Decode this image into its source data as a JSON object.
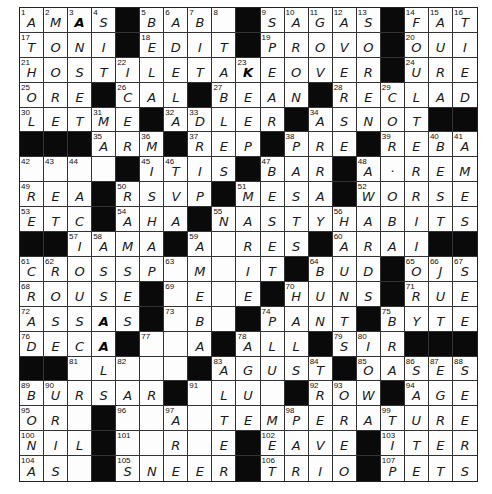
{
  "puzzle": {
    "rows": 19,
    "cols": 19,
    "colors": {
      "black_square": "#0a0a0a",
      "cell_bg": "#fdfdfd",
      "grid_line": "#333333",
      "ink": "#1a1a1a"
    },
    "grid": [
      [
        "A",
        "M",
        "A",
        "S",
        "#",
        "B",
        "A",
        "B",
        "",
        "#",
        "S",
        "A",
        "G",
        "A",
        "S",
        "#",
        "F",
        "A",
        "T"
      ],
      [
        "T",
        "O",
        "N",
        "I",
        "#",
        "E",
        "D",
        "I",
        "T",
        "#",
        "P",
        "R",
        "O",
        "V",
        "O",
        "#",
        "O",
        "U",
        "I"
      ],
      [
        "H",
        "O",
        "S",
        "T",
        "I",
        "L",
        "E",
        "T",
        "A",
        "K",
        "E",
        "O",
        "V",
        "E",
        "R",
        "#",
        "U",
        "R",
        "E"
      ],
      [
        "O",
        "R",
        "E",
        "#",
        "C",
        "A",
        "L",
        "#",
        "B",
        "E",
        "A",
        "N",
        "#",
        "R",
        "E",
        "C",
        "L",
        "A",
        "D"
      ],
      [
        "L",
        "E",
        "T",
        "M",
        "E",
        "#",
        "A",
        "D",
        "L",
        "E",
        "R",
        "#",
        "A",
        "S",
        "N",
        "O",
        "T",
        "#",
        "#"
      ],
      [
        "#",
        "#",
        "#",
        "A",
        "R",
        "M",
        "#",
        "R",
        "E",
        "P",
        "#",
        "P",
        "R",
        "E",
        "#",
        "R",
        "E",
        "B",
        "A"
      ],
      [
        "",
        "",
        "",
        "",
        "#",
        "I",
        "T",
        "I",
        "S",
        "#",
        "B",
        "A",
        "R",
        "#",
        "A",
        "·",
        "R",
        "E",
        "M"
      ],
      [
        "R",
        "E",
        "A",
        "#",
        "R",
        "S",
        "V",
        "P",
        "#",
        "M",
        "E",
        "S",
        "A",
        "#",
        "W",
        "O",
        "R",
        "S",
        "E"
      ],
      [
        "E",
        "T",
        "C",
        "#",
        "A",
        "H",
        "A",
        "#",
        "N",
        "A",
        "S",
        "T",
        "Y",
        "H",
        "A",
        "B",
        "I",
        "T",
        "S"
      ],
      [
        "#",
        "#",
        "I",
        "A",
        "M",
        "A",
        "#",
        "A",
        "",
        "R",
        "E",
        "S",
        "#",
        "A",
        "R",
        "A",
        "I",
        "#",
        "#"
      ],
      [
        "C",
        "R",
        "O",
        "S",
        "S",
        "P",
        "",
        "M",
        "",
        "I",
        "T",
        "#",
        "B",
        "U",
        "D",
        "#",
        "O",
        "J",
        "S"
      ],
      [
        "R",
        "O",
        "U",
        "S",
        "E",
        "#",
        "",
        "E",
        "",
        "E",
        "#",
        "H",
        "U",
        "N",
        "S",
        "#",
        "R",
        "U",
        "E"
      ],
      [
        "A",
        "S",
        "S",
        "A",
        "S",
        "#",
        "",
        "B",
        "",
        "#",
        "P",
        "A",
        "N",
        "T",
        "#",
        "B",
        "Y",
        "T",
        "E"
      ],
      [
        "D",
        "E",
        "C",
        "A",
        "#",
        "",
        "",
        "A",
        "#",
        "A",
        "L",
        "L",
        "#",
        "S",
        "I",
        "R",
        "#",
        "#",
        "#"
      ],
      [
        "#",
        "#",
        "",
        "L",
        "",
        "",
        "",
        "#",
        "A",
        "G",
        "U",
        "S",
        "T",
        "#",
        "O",
        "A",
        "S",
        "E",
        "S"
      ],
      [
        "B",
        "U",
        "R",
        "S",
        "A",
        "R",
        "#",
        "",
        "L",
        "U",
        "",
        "#",
        "R",
        "O",
        "W",
        "#",
        "A",
        "G",
        "E"
      ],
      [
        "O",
        "R",
        "",
        "#",
        "",
        "",
        "A",
        "",
        "T",
        "E",
        "M",
        "P",
        "E",
        "R",
        "A",
        "T",
        "U",
        "R",
        "E"
      ],
      [
        "N",
        "I",
        "L",
        "#",
        "",
        "",
        "R",
        "",
        "E",
        "#",
        "E",
        "A",
        "V",
        "E",
        "#",
        "I",
        "T",
        "E",
        "R"
      ],
      [
        "A",
        "S",
        "",
        "#",
        "S",
        "N",
        "E",
        "E",
        "R",
        "#",
        "T",
        "R",
        "I",
        "O",
        "#",
        "P",
        "E",
        "T",
        "S"
      ]
    ],
    "numbers": {
      "0,0": "1",
      "0,1": "2",
      "0,2": "3",
      "0,3": "4",
      "0,5": "5",
      "0,6": "6",
      "0,7": "7",
      "0,8": "8",
      "0,10": "9",
      "0,11": "10",
      "0,12": "11",
      "0,13": "12",
      "0,14": "13",
      "0,16": "14",
      "0,17": "15",
      "0,18": "16",
      "1,0": "17",
      "1,5": "18",
      "1,10": "19",
      "1,16": "20",
      "2,0": "21",
      "2,4": "22",
      "2,9": "23",
      "2,16": "24",
      "3,0": "25",
      "3,4": "26",
      "3,8": "27",
      "3,13": "28",
      "3,15": "29",
      "4,0": "30",
      "4,3": "31",
      "4,6": "32",
      "4,7": "33",
      "4,12": "34",
      "5,3": "35",
      "5,5": "36",
      "5,7": "37",
      "5,11": "38",
      "5,15": "39",
      "5,17": "40",
      "5,18": "41",
      "6,0": "42",
      "6,1": "43",
      "6,2": "44",
      "6,5": "45",
      "6,6": "46",
      "6,10": "47",
      "6,14": "48",
      "7,0": "49",
      "7,4": "50",
      "7,9": "51",
      "7,14": "52",
      "8,0": "53",
      "8,4": "54",
      "8,8": "55",
      "8,13": "56",
      "9,2": "57",
      "9,3": "58",
      "9,7": "59",
      "9,13": "60",
      "10,0": "61",
      "10,1": "62",
      "10,6": "63",
      "10,12": "64",
      "10,16": "65",
      "10,17": "66",
      "10,18": "67",
      "11,0": "68",
      "11,6": "69",
      "11,11": "70",
      "11,16": "71",
      "12,0": "72",
      "12,6": "73",
      "12,10": "74",
      "12,15": "75",
      "13,0": "76",
      "13,5": "77",
      "13,9": "78",
      "13,13": "79",
      "13,14": "80",
      "14,2": "81",
      "14,4": "82",
      "14,8": "83",
      "14,12": "84",
      "14,14": "85",
      "14,16": "86",
      "14,17": "87",
      "14,18": "88",
      "15,0": "89",
      "15,1": "90",
      "15,7": "91",
      "15,12": "92",
      "15,13": "93",
      "15,16": "94",
      "16,0": "95",
      "16,4": "96",
      "16,6": "97",
      "16,11": "98",
      "16,15": "99",
      "17,0": "100",
      "17,4": "101",
      "17,10": "102",
      "17,15": "103",
      "18,0": "104",
      "18,4": "105",
      "18,10": "106",
      "18,15": "107"
    },
    "dark_letters": [
      "0,2",
      "12,3",
      "13,3",
      "2,9"
    ]
  }
}
